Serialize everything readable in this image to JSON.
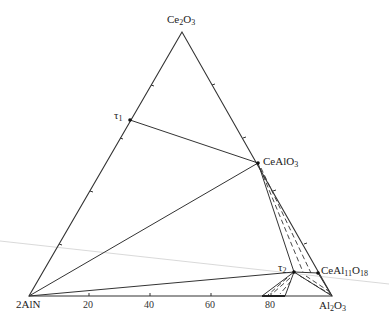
{
  "diagram": {
    "type": "ternary-phase-diagram",
    "vertices": {
      "top": {
        "base": "Ce",
        "sub1": "2",
        "mid": "O",
        "sub2": "3",
        "text": "Ce2O3"
      },
      "left": {
        "text": "2AlN"
      },
      "right": {
        "base": "Al",
        "sub1": "2",
        "mid": "O",
        "sub2": "3",
        "text": "Al2O3"
      }
    },
    "phases": {
      "tau1": {
        "base": "τ",
        "sub": "1"
      },
      "tau2": {
        "base": "τ",
        "sub": "2"
      },
      "cealo3": {
        "base": "CeAlO",
        "sub": "3",
        "text": "CeAlO3"
      },
      "ceal11o18": {
        "p1": "CeAl",
        "s1": "11",
        "p2": "O",
        "s2": "18",
        "text": "CeAl11O18"
      }
    },
    "bottom_axis_ticks": [
      "20",
      "40",
      "60",
      "80"
    ],
    "colors": {
      "line": "#333333",
      "faint_line": "#c8c8c8"
    }
  }
}
